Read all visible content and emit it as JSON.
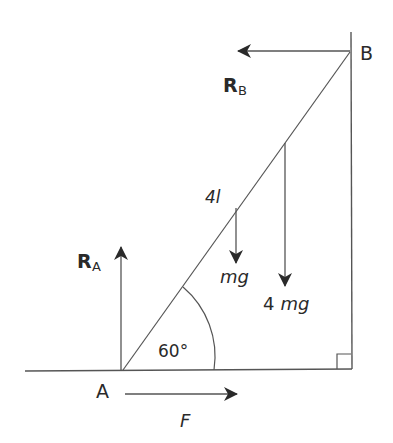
{
  "diagram": {
    "type": "ladder-statics",
    "colors": {
      "line": "#555555",
      "arrow": "#2a2a2a",
      "text": "#2a2a2a",
      "background": "#ffffff"
    },
    "points": {
      "A": {
        "label": "A",
        "x": 123,
        "y": 370
      },
      "B": {
        "label": "B",
        "x": 350,
        "y": 52
      }
    },
    "labels": {
      "point_a": "A",
      "point_b": "B",
      "reaction_a_main": "R",
      "reaction_a_sub": "A",
      "reaction_b_main": "R",
      "reaction_b_sub": "B",
      "length": "4",
      "length_unit": "l",
      "weight_rod": "mg",
      "weight_load_coef": "4",
      "weight_load": "mg",
      "angle": "60°",
      "friction": "F"
    },
    "forces": [
      {
        "name": "R_A",
        "direction": "up",
        "from": [
          121,
          370
        ],
        "to": [
          121,
          247
        ]
      },
      {
        "name": "R_B",
        "direction": "left",
        "from": [
          350,
          51
        ],
        "to": [
          238,
          51
        ]
      },
      {
        "name": "mg",
        "direction": "down",
        "from": [
          236,
          208
        ],
        "to": [
          236,
          262
        ]
      },
      {
        "name": "4 mg",
        "direction": "down",
        "from": [
          285,
          143
        ],
        "to": [
          285,
          285
        ]
      },
      {
        "name": "F",
        "direction": "right",
        "from": [
          125,
          394
        ],
        "to": [
          237,
          394
        ]
      }
    ],
    "angle_deg": 60,
    "right_angle_marker": true
  }
}
